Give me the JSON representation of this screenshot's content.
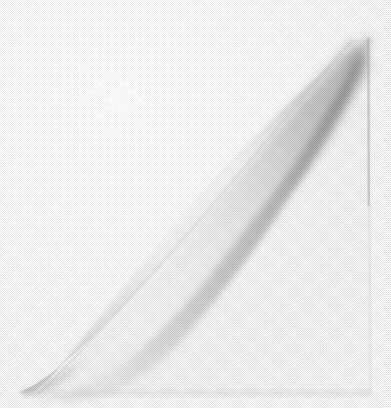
{
  "image": {
    "subject": "curled paper corner",
    "description": "Scanned grayscale photograph of a sheet of white paper whose top-right corner is curled back along a diagonal, casting a soft shadow on the underside.",
    "medium": "halftone scan",
    "orientation": "portrait",
    "width_px": 391,
    "height_px": 408
  },
  "palette": {
    "background_white": "#ffffff",
    "paper_white": "#fdfdfd",
    "highlight_edge": "#f7f7f7",
    "light_gray": "#e8e8e8",
    "mid_gray": "#cfcfcf",
    "shadow_gray": "#b4b4b4",
    "deep_shadow": "#9a9a9a",
    "darkest": "#8c8c8c",
    "baseline_line": "#a8a8a8"
  },
  "geometry": {
    "curl_tip": {
      "x": 368,
      "y": 35
    },
    "curl_foot": {
      "x": 20,
      "y": 392
    },
    "crease_start": {
      "x": 352,
      "y": 40
    },
    "crease_end": {
      "x": 38,
      "y": 394
    },
    "right_edge_x": 369,
    "baseline_y": 395,
    "baseline_start_x": 22,
    "baseline_end_x": 372
  },
  "regions": [
    {
      "name": "upper-left-background",
      "tone": "#ffffff",
      "note": "pure white field above the curl"
    },
    {
      "name": "curl-outer-face",
      "tone": "#ededed",
      "note": "lit convex face of the rolled sheet"
    },
    {
      "name": "curl-underside-shadow",
      "tone": "#9a9a9a",
      "note": "darkest band under the curl at top right"
    },
    {
      "name": "fold-crease-shadow",
      "tone": "#c6c6c6",
      "note": "soft diagonal shadow below the crease"
    },
    {
      "name": "lower-right-sheet",
      "tone": "#fafafa",
      "note": "flat remaining sheet, almost white"
    },
    {
      "name": "bottom-baseline",
      "tone": "#a8a8a8",
      "note": "thin dark line where sheet meets surface"
    }
  ]
}
